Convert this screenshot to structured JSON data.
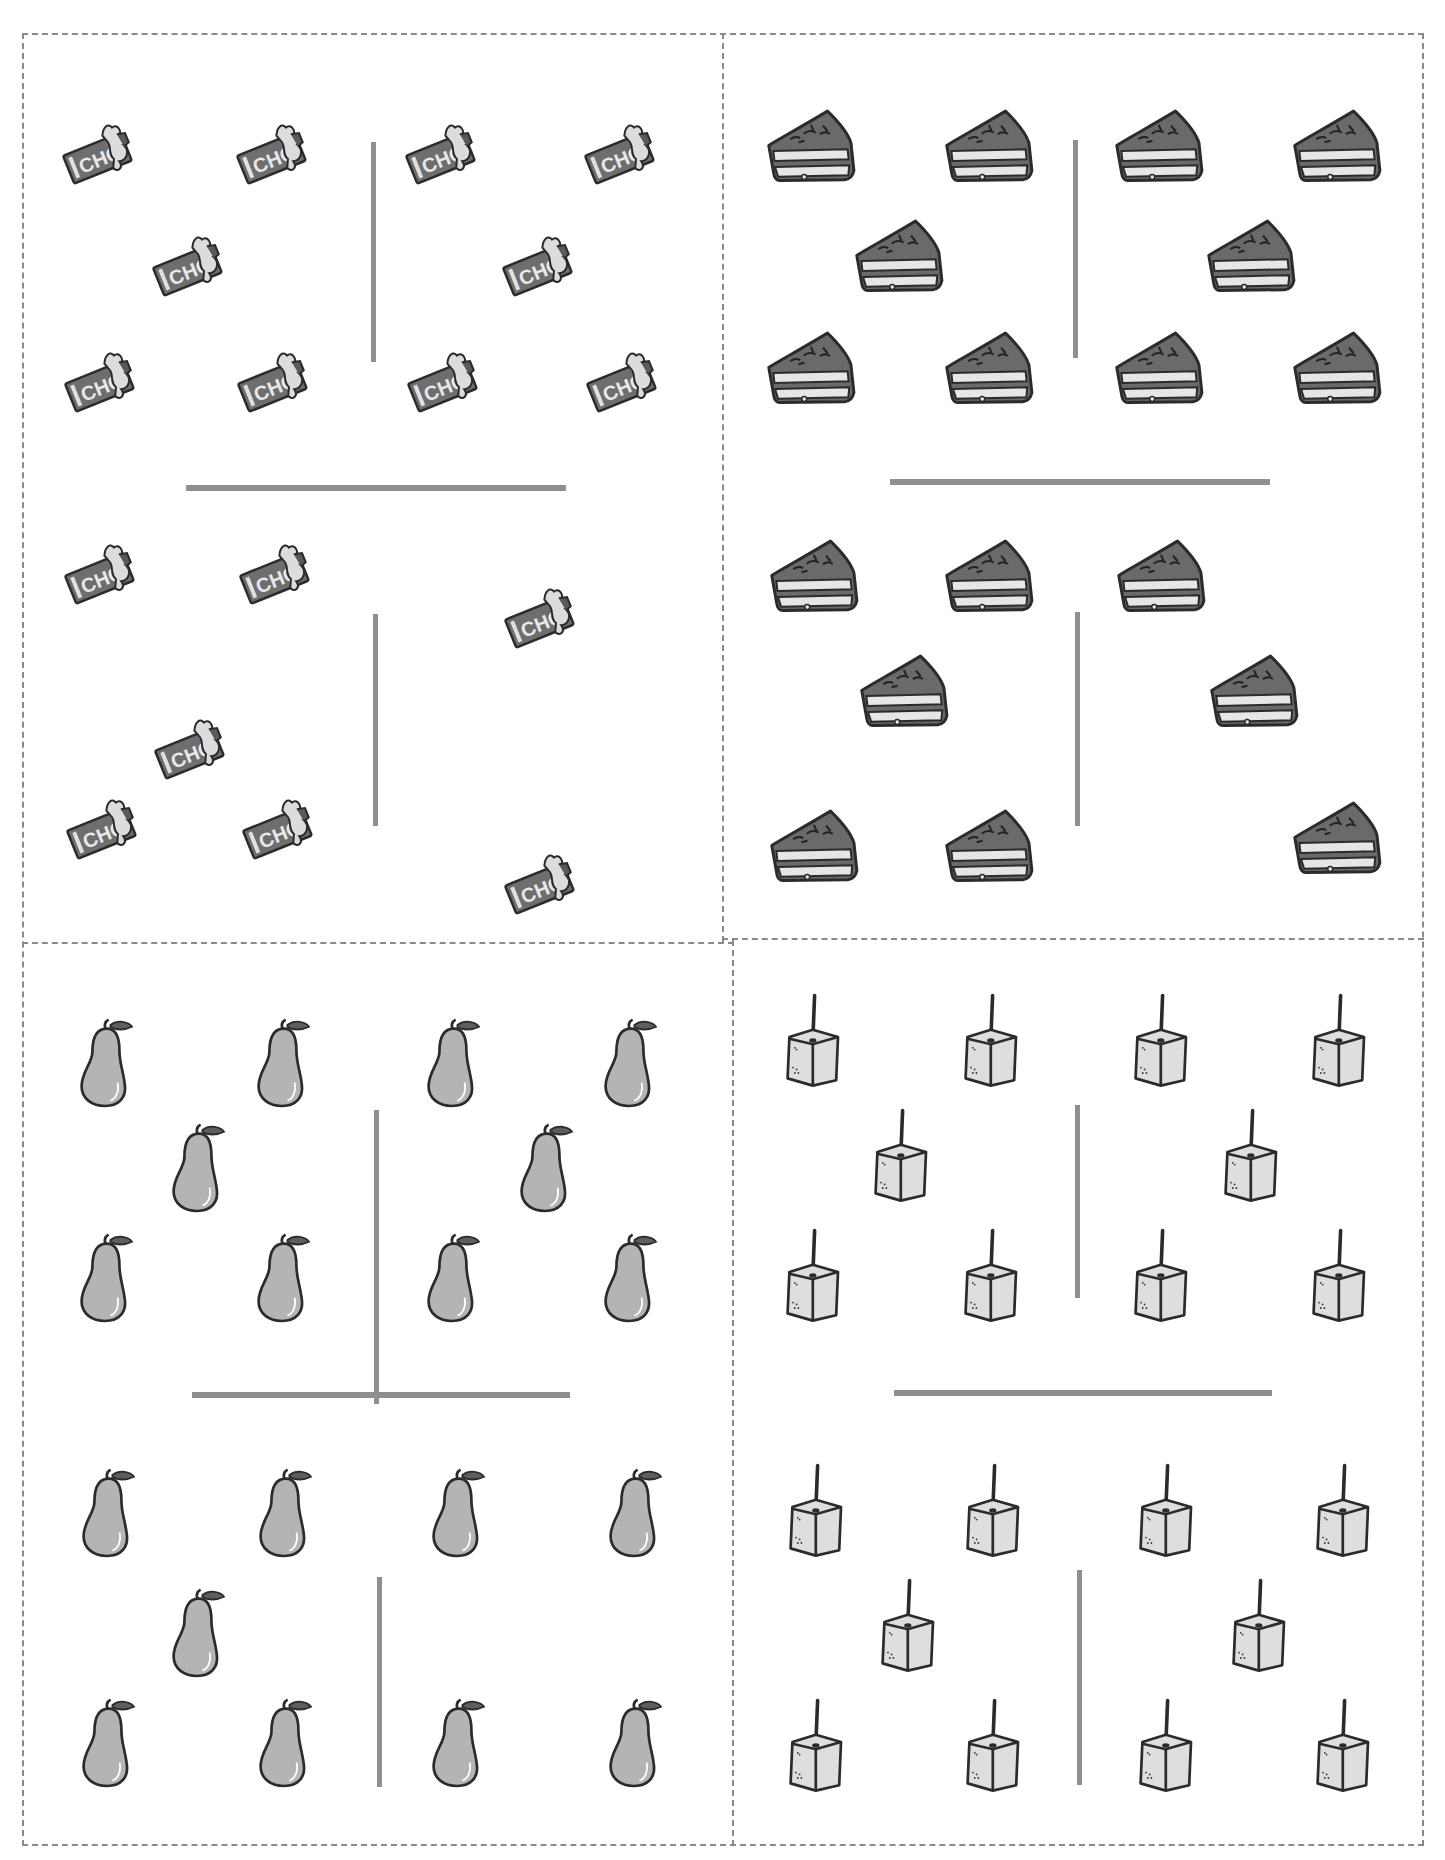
{
  "worksheet": {
    "colors": {
      "border": "#8a8a8a",
      "divider": "#8f8f8f",
      "outline": "#2b2b2b",
      "chocolate": "#6e6e6e",
      "wrapper": "#dcdcdc",
      "cake_top": "#6a6a6a",
      "cake_sponge": "#e6e6e6",
      "pear": "#b4b4b4",
      "caramel": "#dedede"
    },
    "cards": [
      {
        "id": "chocolate",
        "item": "chocolate-bar",
        "label_text": "CHO",
        "vertical_dividers": [
          {
            "x": 373,
            "y1": 142,
            "y2": 362
          },
          {
            "x": 375,
            "y1": 614,
            "y2": 826
          }
        ],
        "horizontal_divider": {
          "y": 488,
          "x1": 186,
          "x2": 566
        },
        "top_group_count": 10,
        "bottom_group_count": 7,
        "items": [
          [
            108,
            150
          ],
          [
            282,
            150
          ],
          [
            451,
            150
          ],
          [
            630,
            150
          ],
          [
            198,
            262
          ],
          [
            548,
            262
          ],
          [
            110,
            378
          ],
          [
            283,
            378
          ],
          [
            453,
            378
          ],
          [
            632,
            378
          ],
          [
            110,
            570
          ],
          [
            285,
            570
          ],
          [
            550,
            614
          ],
          [
            200,
            745
          ],
          [
            112,
            825
          ],
          [
            288,
            825
          ],
          [
            550,
            880
          ]
        ]
      },
      {
        "id": "cake",
        "item": "cake-slice",
        "vertical_dividers": [
          {
            "x": 1075,
            "y1": 140,
            "y2": 358
          },
          {
            "x": 1077,
            "y1": 612,
            "y2": 826
          }
        ],
        "horizontal_divider": {
          "y": 482,
          "x1": 890,
          "x2": 1270
        },
        "top_group_count": 10,
        "bottom_group_count": 8,
        "items": [
          [
            812,
            150
          ],
          [
            990,
            150
          ],
          [
            1160,
            150
          ],
          [
            1338,
            150
          ],
          [
            900,
            260
          ],
          [
            1252,
            260
          ],
          [
            812,
            372
          ],
          [
            990,
            372
          ],
          [
            1160,
            372
          ],
          [
            1338,
            372
          ],
          [
            815,
            580
          ],
          [
            990,
            580
          ],
          [
            1162,
            580
          ],
          [
            905,
            695
          ],
          [
            1255,
            695
          ],
          [
            815,
            850
          ],
          [
            990,
            850
          ],
          [
            1338,
            842
          ]
        ]
      },
      {
        "id": "pear",
        "item": "pear",
        "vertical_dividers": [
          {
            "x": 376,
            "y1": 1110,
            "y2": 1404
          },
          {
            "x": 379,
            "y1": 1577,
            "y2": 1787
          }
        ],
        "horizontal_divider": {
          "y": 1395,
          "x1": 192,
          "x2": 570
        },
        "top_group_count": 10,
        "bottom_group_count": 9,
        "items": [
          [
            108,
            1065
          ],
          [
            285,
            1065
          ],
          [
            455,
            1065
          ],
          [
            632,
            1065
          ],
          [
            200,
            1170
          ],
          [
            548,
            1170
          ],
          [
            108,
            1280
          ],
          [
            285,
            1280
          ],
          [
            455,
            1280
          ],
          [
            632,
            1280
          ],
          [
            110,
            1515
          ],
          [
            287,
            1515
          ],
          [
            460,
            1515
          ],
          [
            637,
            1515
          ],
          [
            200,
            1635
          ],
          [
            110,
            1745
          ],
          [
            287,
            1745
          ],
          [
            460,
            1745
          ],
          [
            637,
            1745
          ]
        ]
      },
      {
        "id": "caramel",
        "item": "caramel-cube",
        "vertical_dividers": [
          {
            "x": 1077,
            "y1": 1105,
            "y2": 1298
          },
          {
            "x": 1079,
            "y1": 1570,
            "y2": 1785
          }
        ],
        "horizontal_divider": {
          "y": 1393,
          "x1": 894,
          "x2": 1272
        },
        "top_group_count": 10,
        "bottom_group_count": 10,
        "items": [
          [
            812,
            1055
          ],
          [
            990,
            1055
          ],
          [
            1160,
            1055
          ],
          [
            1338,
            1055
          ],
          [
            900,
            1170
          ],
          [
            1250,
            1170
          ],
          [
            812,
            1290
          ],
          [
            990,
            1290
          ],
          [
            1160,
            1290
          ],
          [
            1338,
            1290
          ],
          [
            815,
            1525
          ],
          [
            992,
            1525
          ],
          [
            1165,
            1525
          ],
          [
            1342,
            1525
          ],
          [
            907,
            1640
          ],
          [
            1258,
            1640
          ],
          [
            815,
            1760
          ],
          [
            992,
            1760
          ],
          [
            1165,
            1760
          ],
          [
            1342,
            1760
          ]
        ]
      }
    ]
  }
}
